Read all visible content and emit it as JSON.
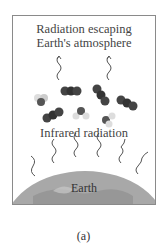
{
  "diagram": {
    "top_label_line1": "Radiation escaping",
    "top_label_line2": "Earth's atmosphere",
    "middle_label": "Infrared radiation",
    "earth_label": "Earth",
    "caption": "(a)",
    "icons": {
      "escaping_waves": "wavy-arrow-icon",
      "molecules": "greenhouse-molecule-icon",
      "infrared_waves": "wavy-arrow-icon",
      "earth": "globe-icon"
    },
    "colors": {
      "frame_border": "#8a8a8a",
      "text": "#444444",
      "molecule_dark": "#3a3a3a",
      "molecule_light": "#d8d8d8",
      "earth": "#9a9a9a"
    }
  }
}
